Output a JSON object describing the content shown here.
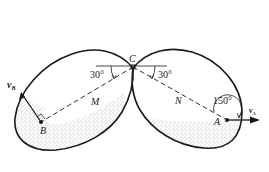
{
  "diagram": {
    "points": {
      "C": "C",
      "B": "B",
      "A": "A"
    },
    "regions": {
      "M": "M",
      "N": "N"
    },
    "angles": {
      "left": "30°",
      "right": "30°",
      "at_A": "150°"
    },
    "velocities": {
      "vB_main": "v",
      "vB_sub": "B",
      "vA_main": "v",
      "vA_sub": "A"
    },
    "colors": {
      "stroke": "#1a1a1a",
      "stipple": "#555555",
      "background": "#ffffff"
    }
  }
}
